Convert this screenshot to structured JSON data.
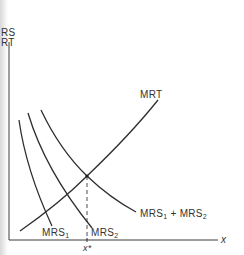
{
  "diagram": {
    "y_axis_labels": [
      "RS",
      "RT"
    ],
    "x_axis_label": "x",
    "equilibrium_label": "x*",
    "curves": {
      "mrt": {
        "label": "MRT"
      },
      "mrs1": {
        "label_main": "MRS",
        "label_sub": "1"
      },
      "mrs2": {
        "label_main": "MRS",
        "label_sub": "2"
      },
      "mrs_sum": {
        "label_a_main": "MRS",
        "label_a_sub": "1",
        "plus": " + ",
        "label_b_main": "MRS",
        "label_b_sub": "2"
      }
    },
    "colors": {
      "curve": "#2e2e2e",
      "axis": "#3a3a3a",
      "text": "#333333"
    }
  }
}
